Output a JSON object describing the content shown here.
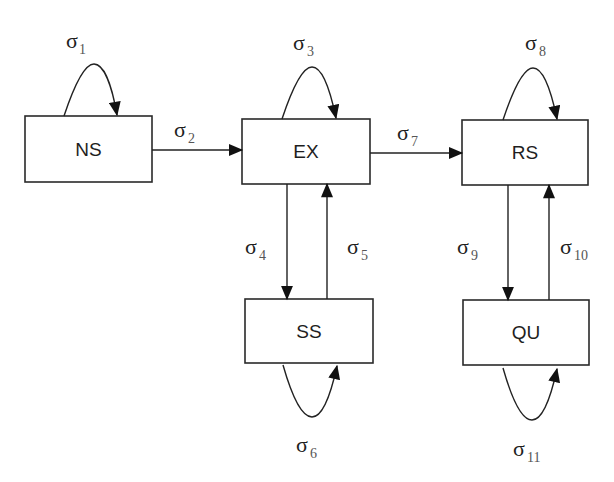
{
  "diagram": {
    "type": "state-transition",
    "states": [
      {
        "id": "NS",
        "label": "NS",
        "x": 25,
        "y": 116,
        "w": 127,
        "h": 66
      },
      {
        "id": "EX",
        "label": "EX",
        "x": 242,
        "y": 119,
        "w": 128,
        "h": 65
      },
      {
        "id": "RS",
        "label": "RS",
        "x": 462,
        "y": 120,
        "w": 126,
        "h": 65
      },
      {
        "id": "SS",
        "label": "SS",
        "x": 245,
        "y": 299,
        "w": 128,
        "h": 64
      },
      {
        "id": "QU",
        "label": "QU",
        "x": 463,
        "y": 300,
        "w": 126,
        "h": 65
      }
    ],
    "transitions": [
      {
        "id": "t1",
        "from": "NS",
        "to": "NS",
        "symbol": "σ",
        "sub": "1"
      },
      {
        "id": "t2",
        "from": "NS",
        "to": "EX",
        "symbol": "σ",
        "sub": "2"
      },
      {
        "id": "t3",
        "from": "EX",
        "to": "EX",
        "symbol": "σ",
        "sub": "3"
      },
      {
        "id": "t4",
        "from": "EX",
        "to": "SS",
        "symbol": "σ",
        "sub": "4"
      },
      {
        "id": "t5",
        "from": "SS",
        "to": "EX",
        "symbol": "σ",
        "sub": "5"
      },
      {
        "id": "t6",
        "from": "SS",
        "to": "SS",
        "symbol": "σ",
        "sub": "6"
      },
      {
        "id": "t7",
        "from": "EX",
        "to": "RS",
        "symbol": "σ",
        "sub": "7"
      },
      {
        "id": "t8",
        "from": "RS",
        "to": "RS",
        "symbol": "σ",
        "sub": "8"
      },
      {
        "id": "t9",
        "from": "RS",
        "to": "QU",
        "symbol": "σ",
        "sub": "9"
      },
      {
        "id": "t10",
        "from": "QU",
        "to": "RS",
        "symbol": "σ",
        "sub": "10"
      },
      {
        "id": "t11",
        "from": "QU",
        "to": "QU",
        "symbol": "σ",
        "sub": "11"
      }
    ]
  },
  "colors": {
    "stroke": "#222222",
    "text": "#1e1e1e",
    "subscript": "#555555",
    "background": "#ffffff"
  }
}
